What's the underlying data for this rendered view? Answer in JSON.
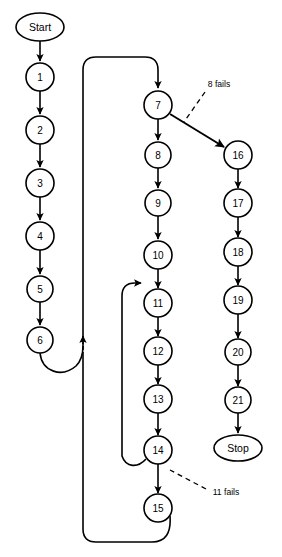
{
  "diagram": {
    "background_color": "#ffffff",
    "stroke_color": "#000000",
    "node_fill": "#ffffff",
    "terminals": {
      "start": {
        "label": "Start",
        "cx": 40,
        "cy": 27,
        "rx": 24,
        "ry": 14
      },
      "stop": {
        "label": "Stop",
        "cx": 238,
        "cy": 448,
        "rx": 24,
        "ry": 13
      }
    },
    "nodes": [
      {
        "id": "n1",
        "label": "1",
        "cx": 40,
        "cy": 77,
        "r": 14
      },
      {
        "id": "n2",
        "label": "2",
        "cx": 40,
        "cy": 130,
        "r": 14
      },
      {
        "id": "n3",
        "label": "3",
        "cx": 40,
        "cy": 183,
        "r": 14
      },
      {
        "id": "n4",
        "label": "4",
        "cx": 40,
        "cy": 236,
        "r": 14
      },
      {
        "id": "n5",
        "label": "5",
        "cx": 40,
        "cy": 289,
        "r": 13
      },
      {
        "id": "n6",
        "label": "6",
        "cx": 40,
        "cy": 340,
        "r": 13
      },
      {
        "id": "n7",
        "label": "7",
        "cx": 158,
        "cy": 105,
        "r": 14
      },
      {
        "id": "n8",
        "label": "8",
        "cx": 158,
        "cy": 155,
        "r": 13
      },
      {
        "id": "n9",
        "label": "9",
        "cx": 158,
        "cy": 203,
        "r": 13
      },
      {
        "id": "n10",
        "label": "10",
        "cx": 158,
        "cy": 255,
        "r": 14
      },
      {
        "id": "n11",
        "label": "11",
        "cx": 158,
        "cy": 303,
        "r": 14
      },
      {
        "id": "n12",
        "label": "12",
        "cx": 158,
        "cy": 351,
        "r": 14
      },
      {
        "id": "n13",
        "label": "13",
        "cx": 158,
        "cy": 399,
        "r": 14
      },
      {
        "id": "n14",
        "label": "14",
        "cx": 158,
        "cy": 450,
        "r": 14
      },
      {
        "id": "n15",
        "label": "15",
        "cx": 158,
        "cy": 508,
        "r": 14
      },
      {
        "id": "n16",
        "label": "16",
        "cx": 238,
        "cy": 155,
        "r": 14
      },
      {
        "id": "n17",
        "label": "17",
        "cx": 238,
        "cy": 203,
        "r": 14
      },
      {
        "id": "n18",
        "label": "18",
        "cx": 238,
        "cy": 252,
        "r": 14
      },
      {
        "id": "n19",
        "label": "19",
        "cx": 238,
        "cy": 300,
        "r": 14
      },
      {
        "id": "n20",
        "label": "20",
        "cx": 238,
        "cy": 352,
        "r": 13
      },
      {
        "id": "n21",
        "label": "21",
        "cx": 238,
        "cy": 400,
        "r": 13
      }
    ],
    "edges": [
      {
        "from": "start",
        "to": "n1",
        "style": "solid"
      },
      {
        "from": "n1",
        "to": "n2",
        "style": "solid"
      },
      {
        "from": "n2",
        "to": "n3",
        "style": "solid"
      },
      {
        "from": "n3",
        "to": "n4",
        "style": "solid"
      },
      {
        "from": "n4",
        "to": "n5",
        "style": "solid"
      },
      {
        "from": "n5",
        "to": "n6",
        "style": "solid"
      },
      {
        "from": "n6",
        "to": "n7",
        "style": "solid",
        "routing": "loop-up-left"
      },
      {
        "from": "n7",
        "to": "n8",
        "style": "solid"
      },
      {
        "from": "n7",
        "to": "n16",
        "style": "solid",
        "routing": "diagonal"
      },
      {
        "from": "n8",
        "to": "n9",
        "style": "solid"
      },
      {
        "from": "n9",
        "to": "n10",
        "style": "solid"
      },
      {
        "from": "n10",
        "to": "n11",
        "style": "solid"
      },
      {
        "from": "n11",
        "to": "n12",
        "style": "solid"
      },
      {
        "from": "n12",
        "to": "n13",
        "style": "solid"
      },
      {
        "from": "n13",
        "to": "n14",
        "style": "solid"
      },
      {
        "from": "n14",
        "to": "n15",
        "style": "solid"
      },
      {
        "from": "n14",
        "to": "n11",
        "style": "solid",
        "routing": "loop-back-inner"
      },
      {
        "from": "n15",
        "to": "n7",
        "style": "solid",
        "routing": "loop-back-outer"
      },
      {
        "from": "n16",
        "to": "n17",
        "style": "solid"
      },
      {
        "from": "n17",
        "to": "n18",
        "style": "solid"
      },
      {
        "from": "n18",
        "to": "n19",
        "style": "solid"
      },
      {
        "from": "n19",
        "to": "n20",
        "style": "solid"
      },
      {
        "from": "n20",
        "to": "n21",
        "style": "solid"
      },
      {
        "from": "n21",
        "to": "stop",
        "style": "solid"
      }
    ],
    "annotations": [
      {
        "id": "a1",
        "label": "8 fails",
        "x": 219,
        "y": 84,
        "leader_from": [
          205,
          92
        ],
        "leader_to": [
          184,
          122
        ]
      },
      {
        "id": "a2",
        "label": "11 fails",
        "x": 226,
        "y": 492,
        "leader_from": [
          206,
          489
        ],
        "leader_to": [
          170,
          470
        ]
      }
    ]
  }
}
